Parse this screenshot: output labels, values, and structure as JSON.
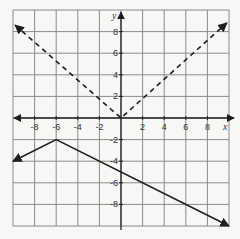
{
  "chart_data": {
    "type": "line",
    "title": "",
    "xlabel": "x",
    "ylabel": "y",
    "xlim": [
      -10,
      10
    ],
    "ylim": [
      -10,
      10
    ],
    "grid": true,
    "grid_step": 2,
    "x_ticks": [
      -8,
      -6,
      -4,
      -2,
      2,
      4,
      6,
      8
    ],
    "y_ticks": [
      8,
      6,
      4,
      2,
      -2,
      -4,
      -6,
      -8
    ],
    "series": [
      {
        "name": "dashed absolute value",
        "style": "dashed",
        "equation": "y = |x|",
        "points": [
          [
            -9.8,
            8.6
          ],
          [
            0,
            0
          ],
          [
            9.8,
            8.8
          ]
        ],
        "arrows": "both"
      },
      {
        "name": "solid absolute value",
        "style": "solid",
        "equation": "y = -1/2|x + 6| - 2",
        "points": [
          [
            -10,
            -4
          ],
          [
            -6,
            -2
          ],
          [
            10,
            -10
          ]
        ],
        "arrows": "both"
      }
    ]
  },
  "labels": {
    "x_axis": "x",
    "y_axis": "y"
  },
  "colors": {
    "grid": "#8a8a8a",
    "axis": "#222222",
    "line": "#1e1e1e",
    "background": "#f7f7f5"
  }
}
